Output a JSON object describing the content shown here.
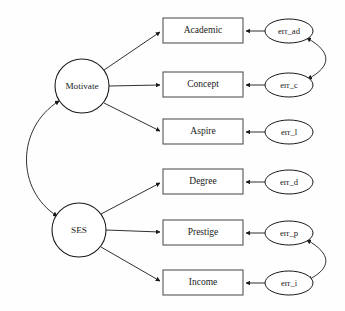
{
  "diagram": {
    "type": "structural-equation-model-path-diagram",
    "title": "",
    "background_color": "#fefefe",
    "stroke_color": "#1a1a1a",
    "box_stroke_color": "#555555",
    "fill_color": "#ffffff",
    "latent_variables": [
      {
        "id": "motivate",
        "label": "Motivate",
        "shape": "circle",
        "cx": 82,
        "cy": 86,
        "r": 27
      },
      {
        "id": "ses",
        "label": "SES",
        "shape": "circle",
        "cx": 79,
        "cy": 230,
        "r": 27
      }
    ],
    "observed_variables": [
      {
        "id": "academic",
        "label": "Academic",
        "shape": "rect",
        "x": 163,
        "y": 18,
        "w": 80,
        "h": 25
      },
      {
        "id": "concept",
        "label": "Concept",
        "shape": "rect",
        "x": 163,
        "y": 72,
        "w": 80,
        "h": 25
      },
      {
        "id": "aspire",
        "label": "Aspire",
        "shape": "rect",
        "x": 163,
        "y": 119,
        "w": 80,
        "h": 25
      },
      {
        "id": "degree",
        "label": "Degree",
        "shape": "rect",
        "x": 163,
        "y": 169,
        "w": 80,
        "h": 25
      },
      {
        "id": "prestige",
        "label": "Prestige",
        "shape": "rect",
        "x": 163,
        "y": 220,
        "w": 80,
        "h": 25
      },
      {
        "id": "income",
        "label": "Income",
        "shape": "rect",
        "x": 163,
        "y": 270,
        "w": 80,
        "h": 25
      }
    ],
    "error_terms": [
      {
        "id": "err_ad",
        "label": "err_ad",
        "shape": "ellipse",
        "cx": 289,
        "cy": 31,
        "rx": 24,
        "ry": 12
      },
      {
        "id": "err_c",
        "label": "err_c",
        "shape": "ellipse",
        "cx": 289,
        "cy": 85,
        "rx": 24,
        "ry": 12
      },
      {
        "id": "err_l",
        "label": "err_l",
        "shape": "ellipse",
        "cx": 289,
        "cy": 132,
        "rx": 24,
        "ry": 12
      },
      {
        "id": "err_d",
        "label": "err_d",
        "shape": "ellipse",
        "cx": 289,
        "cy": 182,
        "rx": 24,
        "ry": 12
      },
      {
        "id": "err_p",
        "label": "err_p",
        "shape": "ellipse",
        "cx": 289,
        "cy": 233,
        "rx": 24,
        "ry": 12
      },
      {
        "id": "err_i",
        "label": "err_i",
        "shape": "ellipse",
        "cx": 289,
        "cy": 283,
        "rx": 24,
        "ry": 12
      }
    ],
    "directed_paths": [
      {
        "from": "motivate",
        "to": "academic",
        "arrowhead": "single"
      },
      {
        "from": "motivate",
        "to": "concept",
        "arrowhead": "single"
      },
      {
        "from": "motivate",
        "to": "aspire",
        "arrowhead": "single"
      },
      {
        "from": "ses",
        "to": "degree",
        "arrowhead": "single"
      },
      {
        "from": "ses",
        "to": "prestige",
        "arrowhead": "single"
      },
      {
        "from": "ses",
        "to": "income",
        "arrowhead": "single"
      },
      {
        "from": "err_ad",
        "to": "academic",
        "arrowhead": "single"
      },
      {
        "from": "err_c",
        "to": "concept",
        "arrowhead": "single"
      },
      {
        "from": "err_l",
        "to": "aspire",
        "arrowhead": "single"
      },
      {
        "from": "err_d",
        "to": "degree",
        "arrowhead": "single"
      },
      {
        "from": "err_p",
        "to": "prestige",
        "arrowhead": "single"
      },
      {
        "from": "err_i",
        "to": "income",
        "arrowhead": "single"
      }
    ],
    "covariance_paths": [
      {
        "between": [
          "motivate",
          "ses"
        ],
        "arrowhead": "double",
        "side": "left"
      },
      {
        "between": [
          "err_ad",
          "err_c"
        ],
        "arrowhead": "double",
        "side": "right"
      },
      {
        "between": [
          "err_p",
          "err_i"
        ],
        "arrowhead": "double",
        "side": "right"
      }
    ]
  }
}
